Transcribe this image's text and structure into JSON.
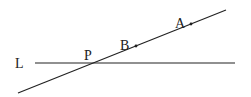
{
  "diagram": {
    "lines": {
      "horizontal": {
        "name": "L",
        "x1": 35,
        "y1": 63,
        "x2": 235,
        "y2": 63
      },
      "diagonal": {
        "x1": 18,
        "y1": 93,
        "x2": 226,
        "y2": 10
      }
    },
    "labels": {
      "L": {
        "text": "L",
        "x": 15,
        "y": 68
      },
      "P": {
        "text": "P",
        "x": 84,
        "y": 60
      },
      "B": {
        "text": "B",
        "x": 120,
        "y": 50
      },
      "A": {
        "text": "A",
        "x": 175,
        "y": 28
      }
    },
    "points": {
      "B": {
        "x": 136,
        "y": 46
      },
      "A": {
        "x": 191,
        "y": 24
      }
    },
    "stroke_color": "#222222"
  }
}
